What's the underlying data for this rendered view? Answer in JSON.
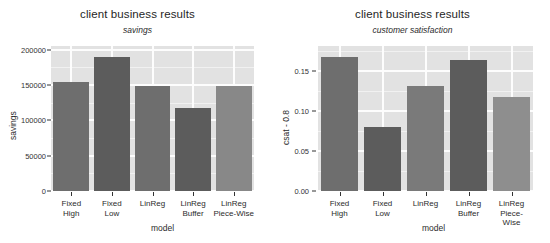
{
  "figure": {
    "width": 550,
    "height": 243,
    "background": "#ffffff",
    "panel_background": "#e2e2e2",
    "gridline_color": "#ffffff"
  },
  "chart_data": [
    {
      "type": "bar",
      "title": "client business results",
      "subtitle": "savings",
      "xlabel": "model",
      "ylabel": "savings",
      "categories": [
        "Fixed\nHigh",
        "Fixed\nLow",
        "LinReg",
        "LinReg\nBuffer",
        "LinReg\nPiece-Wise"
      ],
      "category_labels_flat": [
        "Fixed High",
        "Fixed Low",
        "LinReg",
        "LinReg Buffer",
        "LinReg Piece-Wise"
      ],
      "values": [
        154000,
        190000,
        149000,
        117000,
        149000
      ],
      "bar_colors": [
        "#6e6e6e",
        "#5c5c5c",
        "#6e6e6e",
        "#5c5c5c",
        "#888888"
      ],
      "ylim": [
        0,
        205000
      ],
      "yticks": [
        0,
        50000,
        100000,
        150000,
        200000
      ],
      "ytick_labels": [
        "0",
        "50000",
        "100000",
        "150000",
        "200000"
      ],
      "grid": true,
      "legend": "none"
    },
    {
      "type": "bar",
      "title": "client business results",
      "subtitle": "customer satisfaction",
      "xlabel": "model",
      "ylabel": "csat - 0.8",
      "categories": [
        "Fixed\nHigh",
        "Fixed\nLow",
        "LinReg",
        "LinReg\nBuffer",
        "LinReg\nPiece-Wise"
      ],
      "category_labels_flat": [
        "Fixed High",
        "Fixed Low",
        "LinReg",
        "LinReg Buffer",
        "LinReg Piece-Wise"
      ],
      "values": [
        0.167,
        0.08,
        0.131,
        0.164,
        0.117
      ],
      "bar_colors": [
        "#6e6e6e",
        "#5c5c5c",
        "#7a7a7a",
        "#5c5c5c",
        "#8e8e8e"
      ],
      "ylim": [
        0,
        0.181
      ],
      "yticks": [
        0.0,
        0.05,
        0.1,
        0.15
      ],
      "ytick_labels": [
        "0.00",
        "0.05",
        "0.10",
        "0.15"
      ],
      "grid": true,
      "legend": "none"
    }
  ]
}
